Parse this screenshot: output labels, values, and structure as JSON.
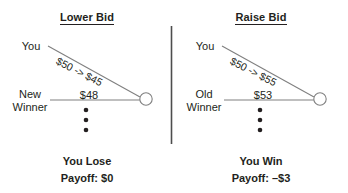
{
  "figure": {
    "background_color": "#ffffff",
    "line_color": "#808080",
    "text_color": "#231f20",
    "divider_color": "#4d4d4d"
  },
  "panels": [
    {
      "id": "lower-bid",
      "title": "Lower Bid",
      "you_label": "You",
      "bid_change": "$50 -> $45",
      "rival_label_line1": "New",
      "rival_label_line2": "Winner",
      "rival_amount": "$48",
      "outcome_result": "You Lose",
      "outcome_payoff": "Payoff: $0"
    },
    {
      "id": "raise-bid",
      "title": "Raise Bid",
      "you_label": "You",
      "bid_change": "$50 -> $55",
      "rival_label_line1": "Old",
      "rival_label_line2": "Winner",
      "rival_amount": "$53",
      "outcome_result": "You Win",
      "outcome_payoff": "Payoff: –$3"
    }
  ],
  "divider": {
    "name": "panel-divider"
  },
  "ellipsis_dots": {
    "count": 3,
    "meaning": "more-bidders-below"
  }
}
